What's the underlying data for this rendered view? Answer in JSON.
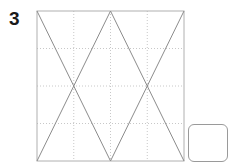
{
  "worksheet": {
    "problem_number": "3",
    "background_color": "#ffffff"
  },
  "figure": {
    "name": "zigzag-triangle-figure",
    "frame": {
      "x": 37,
      "y": 11,
      "width": 147,
      "height": 150,
      "stroke_color": "#b0b0b0",
      "stroke_width": 1
    },
    "grid": {
      "visible": true,
      "style": "dotted",
      "stroke_color": "#c8c8c8",
      "columns": 4,
      "rows": 4,
      "vertical_lines_x": [
        73.75,
        110.5,
        147.25
      ],
      "horizontal_lines_y": [
        48.5,
        86,
        123.5
      ]
    },
    "diagonals": {
      "stroke_color": "#8c8c8c",
      "stroke_width": 1,
      "segments": [
        {
          "name": "down-right-left",
          "x1": 37,
          "y1": 11,
          "x2": 110.5,
          "y2": 161
        },
        {
          "name": "up-right-left",
          "x1": 37,
          "y1": 161,
          "x2": 110.5,
          "y2": 11
        },
        {
          "name": "down-right-right",
          "x1": 110.5,
          "y1": 11,
          "x2": 184,
          "y2": 161
        },
        {
          "name": "up-right-right",
          "x1": 110.5,
          "y1": 161,
          "x2": 184,
          "y2": 11
        }
      ]
    }
  },
  "answer_box": {
    "label": "",
    "placeholder": "",
    "value": "",
    "x": 188,
    "y": 124,
    "width": 40,
    "height": 38,
    "border_color": "#9a9a9a",
    "corner_radius": 6
  }
}
